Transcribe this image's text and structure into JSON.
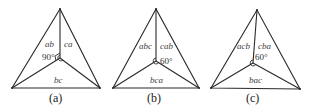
{
  "figure": {
    "panels": [
      {
        "id": "a",
        "caption": "(a)",
        "angle_label": "90°",
        "labels": {
          "left_region": "ab",
          "right_region": "ca",
          "bottom_region": "bc"
        },
        "vertices": {
          "top": [
            60,
            9
          ],
          "left": [
            12,
            88
          ],
          "right": [
            100,
            88
          ],
          "center": [
            60,
            58
          ]
        }
      },
      {
        "id": "b",
        "caption": "(b)",
        "angle_label": "60°",
        "labels": {
          "left_region": "abc",
          "right_region": "cab",
          "bottom_region": "bca"
        },
        "vertices": {
          "top": [
            156,
            9
          ],
          "left": [
            113,
            88
          ],
          "right": [
            199,
            88
          ],
          "center": [
            156,
            61
          ]
        }
      },
      {
        "id": "c",
        "caption": "(c)",
        "angle_label": "60°",
        "labels": {
          "left_region": "acb",
          "right_region": "cba",
          "bottom_region": "bac"
        },
        "vertices": {
          "top": [
            257,
            10
          ],
          "left": [
            211,
            88
          ],
          "right": [
            300,
            89
          ],
          "center": [
            253,
            63
          ]
        }
      }
    ]
  }
}
